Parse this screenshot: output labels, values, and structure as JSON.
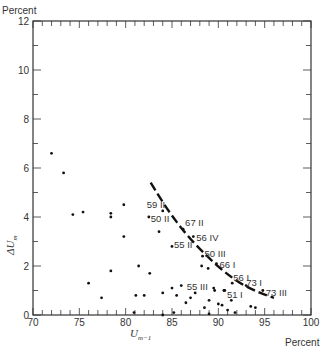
{
  "chart_data": {
    "type": "scatter",
    "title": "",
    "xlabel": "U_{m-1}",
    "ylabel": "ΔU_m",
    "x_unit": "Percent",
    "y_unit": "Percent",
    "xlim": [
      70,
      100
    ],
    "ylim": [
      0,
      12
    ],
    "x_ticks": [
      70,
      75,
      80,
      85,
      90,
      95,
      100
    ],
    "y_ticks": [
      0,
      2,
      4,
      6,
      8,
      10,
      12
    ],
    "grid": false,
    "legend": null,
    "points": [
      {
        "x": 72.0,
        "y": 6.6
      },
      {
        "x": 73.3,
        "y": 5.8
      },
      {
        "x": 74.3,
        "y": 4.1
      },
      {
        "x": 75.4,
        "y": 4.2
      },
      {
        "x": 78.4,
        "y": 4.15
      },
      {
        "x": 78.4,
        "y": 4.0
      },
      {
        "x": 79.8,
        "y": 4.5
      },
      {
        "x": 79.8,
        "y": 3.2
      },
      {
        "x": 78.4,
        "y": 1.8
      },
      {
        "x": 76.0,
        "y": 1.3
      },
      {
        "x": 77.4,
        "y": 0.7
      },
      {
        "x": 81.4,
        "y": 2.0
      },
      {
        "x": 82.6,
        "y": 1.7
      },
      {
        "x": 81.1,
        "y": 0.8
      },
      {
        "x": 82.0,
        "y": 0.8
      },
      {
        "x": 80.9,
        "y": 0.1
      },
      {
        "x": 83.6,
        "y": 3.4
      },
      {
        "x": 84.0,
        "y": 0.9
      },
      {
        "x": 85.0,
        "y": 1.1
      },
      {
        "x": 85.5,
        "y": 0.8
      },
      {
        "x": 86.0,
        "y": 1.2
      },
      {
        "x": 86.5,
        "y": 0.5
      },
      {
        "x": 87.0,
        "y": 0.7
      },
      {
        "x": 87.5,
        "y": 0.9
      },
      {
        "x": 88.2,
        "y": 2.0
      },
      {
        "x": 88.9,
        "y": 1.9
      },
      {
        "x": 88.5,
        "y": 0.3
      },
      {
        "x": 89.0,
        "y": 0.6
      },
      {
        "x": 89.6,
        "y": 1.0
      },
      {
        "x": 90.0,
        "y": 0.45
      },
      {
        "x": 90.4,
        "y": 0.4
      },
      {
        "x": 90.7,
        "y": 1.0
      },
      {
        "x": 91.0,
        "y": 0.2
      },
      {
        "x": 91.4,
        "y": 0.6
      },
      {
        "x": 91.8,
        "y": 0.1
      },
      {
        "x": 93.5,
        "y": 0.35
      },
      {
        "x": 94.0,
        "y": 0.3
      },
      {
        "x": 85.2,
        "y": 0.1
      },
      {
        "x": 84.0,
        "y": 0.0
      },
      {
        "x": 89.0,
        "y": 0.05
      }
    ],
    "labeled_points": [
      {
        "label": "59 II",
        "x": 84.0,
        "y": 4.25
      },
      {
        "label": "50 II",
        "x": 82.5,
        "y": 4.0
      },
      {
        "label": "67 II",
        "x": 86.2,
        "y": 3.5
      },
      {
        "label": "56 IV",
        "x": 87.3,
        "y": 3.2
      },
      {
        "label": "55 II",
        "x": 85.0,
        "y": 2.8
      },
      {
        "label": "50 III",
        "x": 88.3,
        "y": 2.4
      },
      {
        "label": "66 I",
        "x": 89.8,
        "y": 2.1
      },
      {
        "label": "56 I",
        "x": 91.5,
        "y": 1.3
      },
      {
        "label": "55 III",
        "x": 89.5,
        "y": 1.1
      },
      {
        "label": "51 I",
        "x": 90.6,
        "y": 1.0
      },
      {
        "label": "73 I",
        "x": 93.0,
        "y": 1.2
      },
      {
        "label": "73 III",
        "x": 94.8,
        "y": 1.0
      }
    ],
    "curve": {
      "style": "dashed",
      "points": [
        [
          82.7,
          5.4
        ],
        [
          84.5,
          4.3
        ],
        [
          86.5,
          3.3
        ],
        [
          88.5,
          2.5
        ],
        [
          90.5,
          1.8
        ],
        [
          92.5,
          1.25
        ],
        [
          94.5,
          0.9
        ],
        [
          96.0,
          0.7
        ]
      ]
    }
  }
}
